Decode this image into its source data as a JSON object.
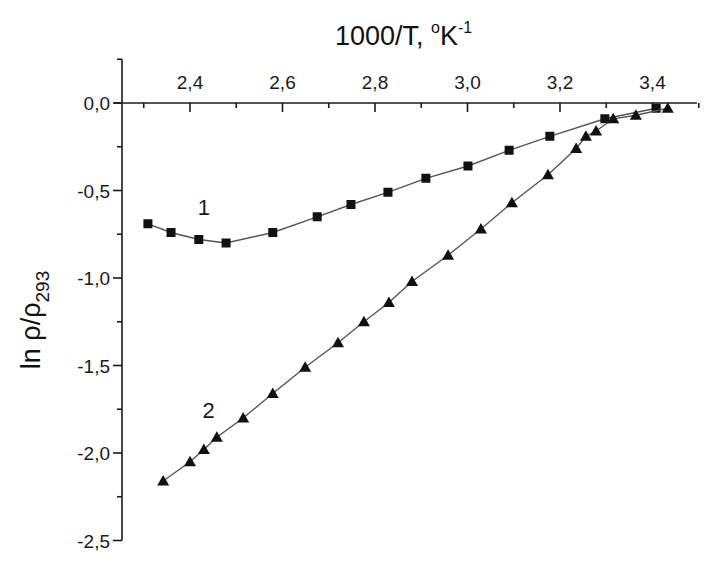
{
  "chart_data": {
    "type": "scatter",
    "title": "",
    "xlabel": "1000/T, °K⁻¹",
    "xlabel_parts": {
      "main": "1000/T, ",
      "degree": "o",
      "unit": "K",
      "exp": "-1"
    },
    "ylabel": "ln ρ/ρ293",
    "ylabel_parts": {
      "main": "ln ρ/ρ",
      "sub": "293"
    },
    "xlim": [
      2.253,
      3.496
    ],
    "ylim": [
      -2.5,
      0.25
    ],
    "x_axis_position": "top",
    "x_ticks": [
      2.4,
      2.6,
      2.8,
      3.0,
      3.2,
      3.4
    ],
    "x_tick_labels": [
      "2,4",
      "2,6",
      "2,8",
      "3,0",
      "3,2",
      "3,4"
    ],
    "x_minor_ticks": [
      2.3,
      2.5,
      2.7,
      2.9,
      3.1,
      3.3,
      3.5
    ],
    "y_ticks": [
      0.0,
      -0.5,
      -1.0,
      -1.5,
      -2.0,
      -2.5
    ],
    "y_tick_labels": [
      "0,0",
      "-0,5",
      "-1,0",
      "-1,5",
      "-2,0",
      "-2,5"
    ],
    "y_minor_ticks": [
      -0.25,
      -0.75,
      -1.25,
      -1.75,
      -2.25
    ],
    "grid": false,
    "legend": null,
    "series": [
      {
        "name": "1",
        "marker": "square",
        "line": true,
        "label_position": {
          "x": 2.43,
          "y": -0.64
        },
        "x": [
          2.309,
          2.359,
          2.419,
          2.478,
          2.579,
          2.675,
          2.748,
          2.828,
          2.91,
          3.001,
          3.09,
          3.178,
          3.297,
          3.408
        ],
        "y": [
          -0.69,
          -0.74,
          -0.78,
          -0.8,
          -0.74,
          -0.65,
          -0.58,
          -0.51,
          -0.43,
          -0.36,
          -0.27,
          -0.19,
          -0.09,
          -0.03
        ]
      },
      {
        "name": "2",
        "marker": "triangle",
        "line": true,
        "label_position": {
          "x": 2.44,
          "y": -1.8
        },
        "x": [
          2.342,
          2.4,
          2.43,
          2.458,
          2.515,
          2.579,
          2.649,
          2.72,
          2.776,
          2.83,
          2.88,
          2.958,
          3.029,
          3.096,
          3.174,
          3.235,
          3.256,
          3.278,
          3.315,
          3.364,
          3.433
        ],
        "y": [
          -2.16,
          -2.05,
          -1.98,
          -1.91,
          -1.8,
          -1.66,
          -1.51,
          -1.37,
          -1.25,
          -1.14,
          -1.02,
          -0.87,
          -0.72,
          -0.57,
          -0.41,
          -0.26,
          -0.19,
          -0.16,
          -0.09,
          -0.07,
          -0.03
        ]
      }
    ]
  },
  "colors": {
    "axis": "#1a1a1a",
    "line": "#555555",
    "marker": "#111111",
    "background": "#ffffff"
  },
  "layout": {
    "x_origin_px": 190,
    "x_origin_val": 2.4,
    "px_per_x_unit": 462.5,
    "y_zero_px": 103,
    "px_per_y_unit": 175,
    "y_axis_px": 122
  }
}
